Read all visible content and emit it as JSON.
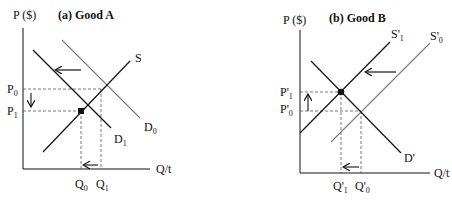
{
  "colors": {
    "black_line": "#111111",
    "gray_line": "#7a7a7a",
    "dashed_guide": "#555555",
    "background": "#ffffff"
  },
  "panel_a": {
    "title": "(a) Good A",
    "y_axis_label": "P ($)",
    "x_axis_label": "Q/t",
    "curves": {
      "supply": "S",
      "demand_initial": "D",
      "demand_initial_sub": "0",
      "demand_new": "D",
      "demand_new_sub": "1"
    },
    "price_ticks": {
      "p0": "P",
      "p0_sub": "0",
      "p1": "P",
      "p1_sub": "1"
    },
    "quantity_ticks": {
      "q0": "Q",
      "q0_sub": "0",
      "q1": "Q",
      "q1_sub": "1"
    },
    "annotations": [
      "demand shifts left",
      "price falls",
      "quantity falls"
    ]
  },
  "panel_b": {
    "title": "(b) Good B",
    "y_axis_label": "P ($)",
    "x_axis_label": "Q/t",
    "curves": {
      "supply_new": "S'",
      "supply_new_sub": "1",
      "supply_initial": "S'",
      "supply_initial_sub": "0",
      "demand": "D'"
    },
    "price_ticks": {
      "p1": "P'",
      "p1_sub": "1",
      "p0": "P'",
      "p0_sub": "0"
    },
    "quantity_ticks": {
      "q1": "Q'",
      "q1_sub": "1",
      "q0": "Q'",
      "q0_sub": "0"
    },
    "annotations": [
      "supply shifts left",
      "price rises",
      "quantity falls"
    ]
  }
}
